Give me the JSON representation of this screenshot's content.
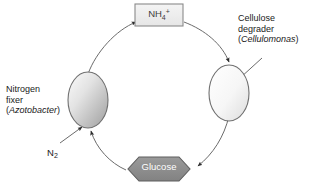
{
  "diagram": {
    "type": "cycle-diagram",
    "background_color": "#ffffff",
    "stroke_color": "#4a4a4a",
    "text_color": "#1a1a1a",
    "nodes": {
      "nh4": {
        "shape": "rectangle",
        "label_main": "NH",
        "label_sub": "4",
        "label_sup": "+",
        "full_label": "NH4+",
        "fill_color": "#f0f0f0",
        "border_color": "#808080",
        "text_color": "#3d3d3d"
      },
      "glucose": {
        "shape": "hexagon",
        "label": "Glucose",
        "fill_color": "#8c8c8c",
        "border_color": "#595959",
        "text_color": "#ffffff"
      },
      "nitrogen_fixer_cell": {
        "shape": "ellipse",
        "fill_gradient_light": "#f7f7f7",
        "fill_gradient_dark": "#a8a8a8",
        "border_color": "#6e6e6e"
      },
      "cellulose_degrader_cell": {
        "shape": "ellipse",
        "fill_gradient_light": "#ffffff",
        "fill_gradient_dark": "#e2e2e2",
        "border_color": "#6e6e6e"
      }
    },
    "labels": {
      "nitrogen_fixer": {
        "line1": "Nitrogen",
        "line2": "fixer",
        "line3_open": "(",
        "line3_species": "Azotobacter",
        "line3_close": ")"
      },
      "cellulose_degrader": {
        "line1": "Cellulose",
        "line2": "degrader",
        "line3_open": "(",
        "line3_species": "Cellulomonas",
        "line3_close": ")"
      },
      "n2": {
        "main": "N",
        "sub": "2",
        "full": "N2"
      }
    },
    "arrows": [
      {
        "name": "nitrogen-fixer-to-nh4",
        "from": "nitrogen_fixer_cell",
        "to": "nh4",
        "style": "curved",
        "direction": "clockwise"
      },
      {
        "name": "nh4-to-cellulose-degrader",
        "from": "nh4",
        "to": "cellulose_degrader_cell",
        "style": "curved",
        "direction": "clockwise"
      },
      {
        "name": "cellulose-degrader-to-glucose",
        "from": "cellulose_degrader_cell",
        "to": "glucose",
        "style": "curved",
        "direction": "clockwise"
      },
      {
        "name": "glucose-to-nitrogen-fixer",
        "from": "glucose",
        "to": "nitrogen_fixer_cell",
        "style": "curved",
        "direction": "clockwise"
      },
      {
        "name": "n2-uptake",
        "from": "n2",
        "to": "nitrogen_fixer_cell",
        "style": "straight",
        "direction": "inward"
      },
      {
        "name": "cellulose-degrader-label-pointer",
        "from": "cellulose_degrader_label",
        "to": "cellulose_degrader_cell",
        "style": "straight",
        "direction": "inward"
      }
    ]
  }
}
